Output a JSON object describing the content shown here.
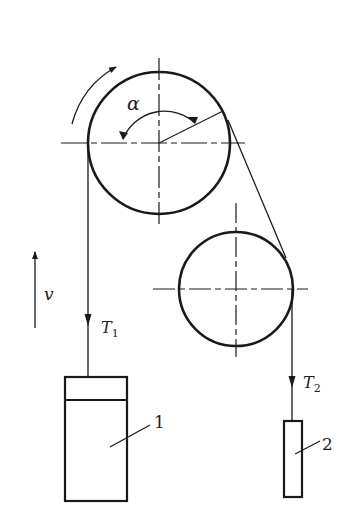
{
  "diagram": {
    "type": "pulley-system",
    "labels": {
      "angle": "α",
      "velocity": "v",
      "tension1_main": "T",
      "tension1_sub": "1",
      "tension2_main": "T",
      "tension2_sub": "2",
      "body1": "1",
      "body2": "2"
    },
    "colors": {
      "stroke": "#1a1a1a",
      "background": "#ffffff"
    },
    "pulleys": [
      {
        "name": "large-pulley",
        "cx": 159,
        "cy": 143,
        "r": 71
      },
      {
        "name": "small-pulley",
        "cx": 236,
        "cy": 289,
        "r": 57
      }
    ],
    "bodies": [
      {
        "name": "body-1",
        "x": 65,
        "y": 377,
        "w": 62,
        "h": 124,
        "divider_y": 400
      },
      {
        "name": "body-2",
        "x": 284,
        "y": 421,
        "w": 18,
        "h": 76
      }
    ]
  }
}
